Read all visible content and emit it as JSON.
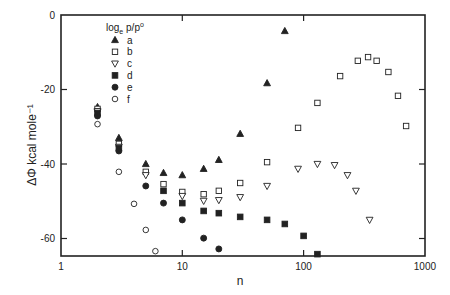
{
  "chart_data": {
    "type": "scatter",
    "title": "",
    "xlabel": "n",
    "ylabel": "ΔΦ kcal mole⁻¹",
    "xscale": "log",
    "xlim": [
      1,
      1000
    ],
    "ylim": [
      -64.7,
      0
    ],
    "xticks": [
      1,
      10,
      100,
      1000
    ],
    "xtick_labels": [
      "1",
      "10",
      "100",
      "1000"
    ],
    "yticks": [
      0,
      -20,
      -40,
      -60
    ],
    "ytick_labels": [
      "0",
      "-20",
      "-40",
      "-60"
    ],
    "grid": false,
    "legend": {
      "title": "log",
      "title_sub": "e",
      "title_rest": " p/p",
      "title_sup": "o",
      "position": "upper-left-inside"
    },
    "series": [
      {
        "name": "a",
        "marker": "triangle-up",
        "filled": true,
        "x": [
          2,
          3,
          5,
          7,
          10,
          15,
          20,
          30,
          50,
          70
        ],
        "y": [
          -24.7,
          -33.0,
          -40.0,
          -42.4,
          -43.0,
          -41.3,
          -38.9,
          -31.9,
          -18.3,
          -4.3
        ]
      },
      {
        "name": "b",
        "marker": "square",
        "filled": false,
        "x": [
          2,
          3,
          5,
          7,
          10,
          15,
          20,
          30,
          50,
          90,
          130,
          200,
          280,
          340,
          400,
          500,
          600,
          700
        ],
        "y": [
          -25.2,
          -34.6,
          -42.1,
          -45.4,
          -47.5,
          -48.1,
          -47.2,
          -45.1,
          -39.5,
          -30.3,
          -23.6,
          -16.4,
          -12.3,
          -11.3,
          -12.3,
          -15.3,
          -21.7,
          -29.8
        ]
      },
      {
        "name": "c",
        "marker": "triangle-down",
        "filled": false,
        "x": [
          2,
          3,
          5,
          10,
          15,
          20,
          30,
          50,
          90,
          130,
          180,
          230,
          270,
          350
        ],
        "y": [
          -25.8,
          -35.4,
          -43.0,
          -48.6,
          -49.9,
          -49.7,
          -48.9,
          -45.9,
          -41.3,
          -40.0,
          -40.3,
          -43.0,
          -47.2,
          -55.0
        ]
      },
      {
        "name": "d",
        "marker": "square",
        "filled": true,
        "x": [
          2,
          3,
          7,
          10,
          15,
          20,
          30,
          50,
          70,
          100,
          130
        ],
        "y": [
          -26.3,
          -35.7,
          -47.2,
          -50.5,
          -52.6,
          -53.2,
          -54.2,
          -55.0,
          -56.1,
          -59.3,
          -64.2
        ]
      },
      {
        "name": "e",
        "marker": "circle",
        "filled": true,
        "x": [
          2,
          3,
          5,
          7,
          10,
          15,
          20
        ],
        "y": [
          -27.1,
          -36.5,
          -45.9,
          -50.5,
          -55.0,
          -59.9,
          -62.8
        ]
      },
      {
        "name": "f",
        "marker": "circle",
        "filled": false,
        "x": [
          2,
          3,
          4,
          5,
          6
        ],
        "y": [
          -29.3,
          -42.1,
          -50.7,
          -57.7,
          -63.4
        ]
      }
    ]
  },
  "layout": {
    "plot_left": 61,
    "plot_right": 425,
    "plot_top": 15,
    "plot_bottom": 256,
    "decade_px": 121.3,
    "px_per_unit_y": 3.725,
    "ink_color": "#222222"
  }
}
